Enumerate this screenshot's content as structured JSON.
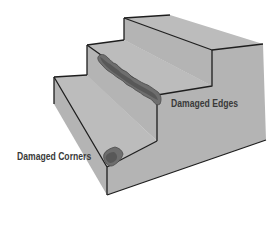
{
  "diagram": {
    "labels": {
      "edges": "Damaged Edges",
      "corners": "Damaged Corners"
    },
    "colors": {
      "face": "#b4b4b4",
      "face_light": "#bcbcbc",
      "outline": "#1e1e1e",
      "damage": "#6e6e6e",
      "damage_dark": "#4a4a4a",
      "text": "#3a3a3a",
      "background": "#ffffff"
    }
  }
}
